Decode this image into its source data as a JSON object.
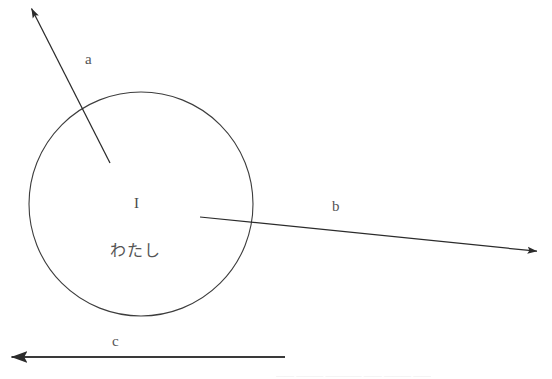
{
  "figure": {
    "type": "vector-diagram",
    "background_color": "#ffffff",
    "stroke_color": "#333333",
    "text_color": "#4a4a4a",
    "width": 552,
    "height": 379,
    "circle": {
      "name": "self-circle",
      "center_x": 141,
      "center_y": 204,
      "radius": 112,
      "stroke_width": 1.1,
      "fill": "none",
      "labels": {
        "english": "I",
        "japanese": "わたし"
      }
    },
    "vectors": [
      {
        "id": "a",
        "label": "a",
        "label_x": 88,
        "label_y": 62,
        "tail_x": 110,
        "tail_y": 163,
        "head_x": 28,
        "head_y": 6,
        "direction": "up-left",
        "origin": "inside-circle"
      },
      {
        "id": "b",
        "label": "b",
        "label_x": 336,
        "label_y": 208,
        "tail_x": 200,
        "tail_y": 217,
        "head_x": 545,
        "head_y": 252,
        "direction": "right",
        "origin": "inside-circle"
      },
      {
        "id": "c",
        "label": "c",
        "label_x": 116,
        "label_y": 342,
        "tail_x": 285,
        "tail_y": 357,
        "head_x": 3,
        "head_y": 357,
        "direction": "left",
        "origin": "below-circle"
      }
    ],
    "cutoff_text": "―― ――― ―――― ―― ――― ――"
  }
}
